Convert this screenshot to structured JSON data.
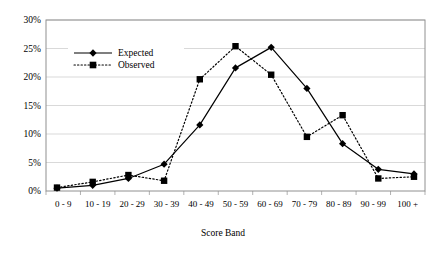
{
  "chart_data": {
    "type": "line",
    "title": "",
    "xlabel": "Score Band",
    "ylabel": "",
    "categories": [
      "0 - 9",
      "10 - 19",
      "20 - 29",
      "30 - 39",
      "40 - 49",
      "50 - 59",
      "60 - 69",
      "70 - 79",
      "80 - 89",
      "90 - 99",
      "100 +"
    ],
    "series": [
      {
        "name": "Expected",
        "marker": "diamond",
        "linestyle": "solid",
        "color": "#000000",
        "values": [
          0.5,
          1.0,
          2.2,
          4.7,
          11.6,
          21.6,
          25.2,
          18.0,
          8.3,
          3.8,
          3.0
        ]
      },
      {
        "name": "Observed",
        "marker": "square",
        "linestyle": "dotted",
        "color": "#000000",
        "values": [
          0.6,
          1.6,
          2.8,
          1.8,
          19.6,
          25.4,
          20.4,
          9.5,
          13.3,
          2.2,
          2.5
        ]
      }
    ],
    "ylim": [
      0,
      30
    ],
    "yticks": [
      0,
      5,
      10,
      15,
      20,
      25,
      30
    ],
    "ytick_labels": [
      "0%",
      "5%",
      "10%",
      "15%",
      "20%",
      "25%",
      "30%"
    ],
    "grid": true,
    "grid_axis": "y",
    "grid_color": "#c8c8c8",
    "legend_position": "upper-left-inside",
    "plot_border_color": "#808080",
    "axis_color": "#808080",
    "background": "#ffffff"
  }
}
